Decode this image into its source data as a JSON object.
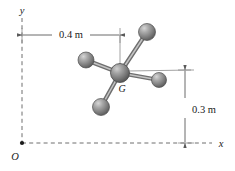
{
  "figure": {
    "background_color": "#ffffff",
    "line_color": "#5a5a5a",
    "text_color": "#1a1a1a"
  },
  "axes": {
    "origin_label": "O",
    "x_label": "x",
    "y_label": "y",
    "style": "dashed",
    "origin_point": {
      "x": 22,
      "y": 143
    },
    "x_axis_end": {
      "x": 212,
      "y": 143
    },
    "y_axis_top": {
      "x": 22,
      "y": 18
    }
  },
  "dimensions": [
    {
      "name": "horizontal-dimension",
      "label": "0.4 m",
      "value": 0.4,
      "unit": "m",
      "orientation": "horizontal",
      "from": {
        "x": 22,
        "y": 35
      },
      "to": {
        "x": 120,
        "y": 35
      },
      "text_position": {
        "x": 71,
        "y": 32
      }
    },
    {
      "name": "vertical-dimension",
      "label": "0.3 m",
      "value": 0.3,
      "unit": "m",
      "orientation": "vertical",
      "from": {
        "x": 185,
        "y": 70
      },
      "to": {
        "x": 185,
        "y": 143
      },
      "text_position": {
        "x": 192,
        "y": 110
      }
    }
  ],
  "body": {
    "center_label": "G",
    "center_label_position": {
      "x": 122,
      "y": 91
    },
    "center_sphere": {
      "cx": 120,
      "cy": 73,
      "r": 9.5
    },
    "atoms": [
      {
        "name": "sphere-top-right",
        "cx": 147,
        "cy": 32,
        "r": 8.5
      },
      {
        "name": "sphere-left",
        "cx": 86,
        "cy": 60,
        "r": 8.0
      },
      {
        "name": "sphere-right",
        "cx": 159,
        "cy": 80,
        "r": 7.5
      },
      {
        "name": "sphere-bottom-left",
        "cx": 101,
        "cy": 107,
        "r": 8.5
      }
    ],
    "sphere_colors": {
      "highlight": "#c9c9c9",
      "mid": "#8e8e8e",
      "shadow": "#555555",
      "outline": "#4a4a4a"
    },
    "bond_color": "#707070"
  },
  "leader_lines": [
    {
      "name": "vertical-extension-to-center",
      "from": {
        "x": 120,
        "y": 35
      },
      "to": {
        "x": 120,
        "y": 73
      }
    },
    {
      "name": "horizontal-extension-to-center",
      "from": {
        "x": 120,
        "y": 73
      },
      "to": {
        "x": 191,
        "y": 70
      }
    }
  ]
}
